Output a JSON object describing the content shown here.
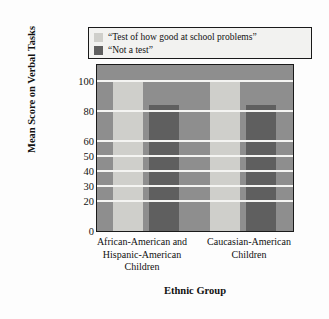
{
  "chart_data": {
    "type": "bar",
    "title": "",
    "xlabel": "Ethnic Group",
    "ylabel": "Mean Score on Verbal Tasks",
    "categories": [
      "African-American and Hispanic-American Children",
      "Caucasian-American Children"
    ],
    "category_lines": [
      [
        "African-American and",
        "Hispanic-American",
        "Children"
      ],
      [
        "Caucasian-American",
        "Children"
      ]
    ],
    "series": [
      {
        "name": "“Test of how good at school problems”",
        "color": "#cfcfcb",
        "values": [
          100,
          100
        ]
      },
      {
        "name": "“Not a test”",
        "color": "#5f5f5f",
        "values": [
          84,
          84
        ]
      }
    ],
    "ylim": [
      0,
      110
    ],
    "yticks": [
      0,
      20,
      30,
      40,
      50,
      60,
      80,
      100
    ],
    "ytick_labels": [
      "0",
      "20",
      "30",
      "40",
      "50",
      "60",
      "80",
      "100"
    ],
    "grid": true,
    "gridline_color": "#f4f4f2",
    "plot_background": "#8e8e8e",
    "legend_position": "above-plot"
  },
  "legend": {
    "items": [
      {
        "label": "“Test of how good at school problems”",
        "color": "#cfcfcb"
      },
      {
        "label": "“Not a test”",
        "color": "#5f5f5f"
      }
    ]
  }
}
